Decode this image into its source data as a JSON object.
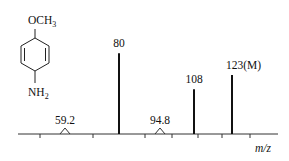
{
  "chart_data": {
    "type": "bar",
    "xlabel": "m/z",
    "ylabel": "",
    "peaks": [
      {
        "mz": 80,
        "label": "80",
        "relative_intensity": 0.85
      },
      {
        "mz": 108,
        "label": "108",
        "relative_intensity": 0.47
      },
      {
        "mz": 123,
        "label": "123(M)",
        "relative_intensity": 0.62
      }
    ],
    "metastable_peaks": [
      {
        "mz": 59.2,
        "label": "59.2"
      },
      {
        "mz": 94.8,
        "label": "94.8"
      }
    ],
    "grid": false,
    "legend": "none"
  },
  "molecule": {
    "top_group": "OCH",
    "top_sub": "3",
    "bottom_group": "NH",
    "bottom_sub": "2"
  }
}
